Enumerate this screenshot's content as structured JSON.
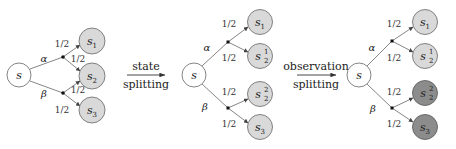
{
  "colors": {
    "node_white": "#ffffff",
    "node_light": "#d9d9d9",
    "node_dark": "#8c8c8c",
    "edge": "#777777"
  },
  "diagram1": {
    "root": "s",
    "actions": [
      "α",
      "β"
    ],
    "prob_labels": [
      "1/2",
      "1/2",
      "1/2",
      "1/2"
    ],
    "nodes": [
      {
        "base": "s",
        "sub": "1",
        "sup": ""
      },
      {
        "base": "s",
        "sub": "2",
        "sup": ""
      },
      {
        "base": "s",
        "sub": "3",
        "sup": ""
      }
    ]
  },
  "arrow1": {
    "line1": "state",
    "line2": "splitting"
  },
  "diagram2": {
    "root": "s",
    "actions": [
      "α",
      "β"
    ],
    "prob_labels": [
      "1/2",
      "1/2",
      "1/2",
      "1/2"
    ],
    "nodes": [
      {
        "base": "s",
        "sub": "1",
        "sup": ""
      },
      {
        "base": "s",
        "sub": "2",
        "sup": "1"
      },
      {
        "base": "s",
        "sub": "2",
        "sup": "2"
      },
      {
        "base": "s",
        "sub": "3",
        "sup": ""
      }
    ]
  },
  "arrow2": {
    "line1": "observation",
    "line2": "splitting"
  },
  "diagram3": {
    "root": "s",
    "actions": [
      "α",
      "β"
    ],
    "prob_labels": [
      "1/2",
      "1/2",
      "1/2",
      "1/2"
    ],
    "nodes": [
      {
        "base": "s",
        "sub": "1",
        "sup": "",
        "shade": "light"
      },
      {
        "base": "s",
        "sub": "2",
        "sup": "1",
        "shade": "light"
      },
      {
        "base": "s",
        "sub": "2",
        "sup": "2",
        "shade": "dark"
      },
      {
        "base": "s",
        "sub": "3",
        "sup": "",
        "shade": "dark"
      }
    ]
  }
}
